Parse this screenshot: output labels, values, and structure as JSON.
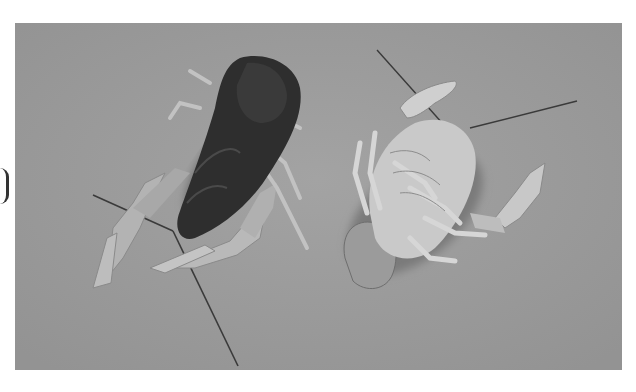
{
  "image": {
    "description": "Grayscale photograph of two crayfish on a gray background: one dark specimen seen from above on the left, and a pale molted exoskeleton seen from below on the right",
    "subjects": [
      {
        "name": "crayfish-dorsal",
        "tone": "#2e2e2e"
      },
      {
        "name": "crayfish-ventral",
        "tone": "#c9c9c9"
      }
    ],
    "colors": {
      "background": "#9a9a9a",
      "page": "#ffffff",
      "dark_body": "#2e2e2e",
      "pale_body": "#c9c9c9",
      "claw_light": "#b8b8b8"
    }
  }
}
